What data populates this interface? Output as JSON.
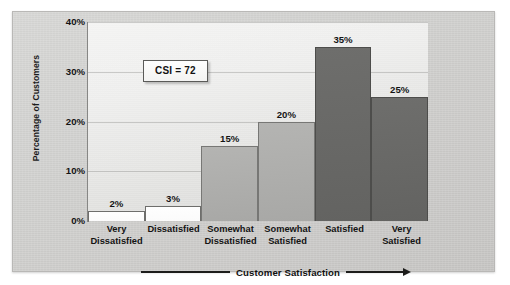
{
  "chart_data": {
    "type": "bar",
    "title": "",
    "xlabel": "Customer Satisfaction",
    "ylabel": "Percentage of Customers",
    "categories": [
      "Very\nDissatisfied",
      "Dissatisfied",
      "Somewhat\nDissatisfied",
      "Somewhat\nSatisfied",
      "Satisfied",
      "Very\nSatisfied"
    ],
    "values": [
      2,
      3,
      15,
      20,
      35,
      25
    ],
    "value_labels": [
      "2%",
      "3%",
      "15%",
      "20%",
      "35%",
      "25%"
    ],
    "bar_colors": [
      "#fefefe",
      "#fefefe",
      "#b0b0ae",
      "#b0b0ae",
      "#6b6b69",
      "#6b6b69"
    ],
    "bar_tones": [
      "light",
      "light",
      "mid",
      "mid",
      "dark",
      "dark"
    ],
    "ylim": [
      0,
      40
    ],
    "ytick_values": [
      0,
      10,
      20,
      30,
      40
    ],
    "ytick_labels": [
      "0%",
      "10%",
      "20%",
      "30%",
      "40%"
    ],
    "grid": true,
    "legend": "none",
    "annotations": [
      {
        "name": "csi-callout",
        "text": "CSI = 72"
      }
    ]
  },
  "axis": {
    "y_title": "Percentage of Customers",
    "x_caption": "Customer Satisfaction"
  },
  "colors": {
    "panel_background": "#cfcfcd",
    "plot_background": "#eeeeed",
    "axis_line": "#6e6e6c",
    "text": "#141414",
    "bar_light": "#fefefe",
    "bar_mid": "#b0b0ae",
    "bar_dark": "#6b6b69"
  }
}
